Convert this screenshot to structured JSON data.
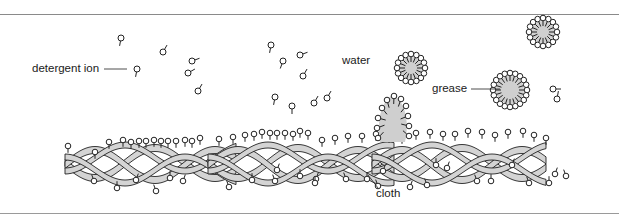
{
  "diagram": {
    "labels": {
      "detergent_ion": "detergent ion",
      "water": "water",
      "grease": "grease",
      "cloth": "cloth"
    },
    "colors": {
      "ink": "#222222",
      "fiber_fill": "#d4d4d4",
      "grease_fill": "#cfcfcf",
      "rule": "#8a8a8a"
    },
    "components": [
      {
        "id": "free-ions",
        "description": "free detergent ions dispersed in water",
        "count": 22
      },
      {
        "id": "micelles",
        "description": "grease droplets surrounded by detergent ions",
        "count": 4
      },
      {
        "id": "lifting-grease",
        "description": "grease blob being lifted from cloth surface",
        "count": 1
      },
      {
        "id": "cloth",
        "description": "woven cloth fibers with adsorbed detergent ions",
        "count": 1
      }
    ]
  }
}
